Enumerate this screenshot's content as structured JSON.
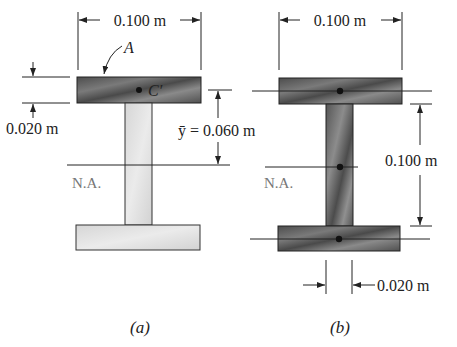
{
  "figure_a": {
    "caption": "(a)",
    "top_width_label": "0.100 m",
    "area_label": "A",
    "centroid_label": "C′",
    "flange_thickness_label": "0.020 m",
    "ybar_label": "ȳ = 0.060 m",
    "neutral_axis_label": "N.A."
  },
  "figure_b": {
    "caption": "(b)",
    "top_width_label": "0.100 m",
    "height_label": "0.100 m",
    "web_thickness_label": "0.020 m",
    "neutral_axis_label": "N.A."
  },
  "colors": {
    "dark_hatched": "#5a5a5a",
    "light_fill": "#d8d8d8",
    "line": "#222222"
  }
}
